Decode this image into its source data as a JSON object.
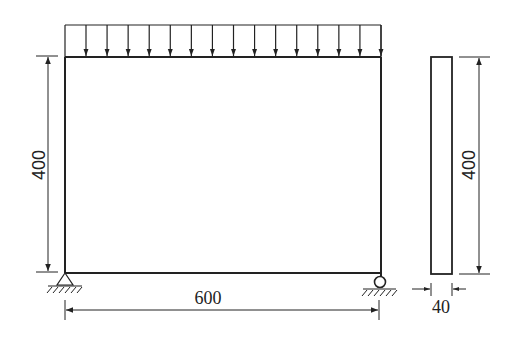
{
  "diagram": {
    "type": "structural frame with uniformly distributed load",
    "load": {
      "arrow_count": 15,
      "description": "uniform distributed load on top beam"
    },
    "frame": {
      "width_label": "600",
      "height_label": "400",
      "left_support": "pin",
      "right_support": "roller"
    },
    "section": {
      "height_label": "400",
      "width_label": "40"
    },
    "colors": {
      "stroke": "#222222",
      "background": "#ffffff"
    }
  }
}
